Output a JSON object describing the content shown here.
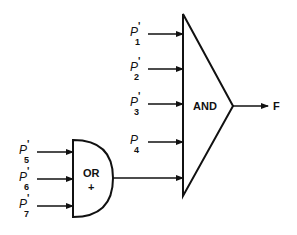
{
  "diagram": {
    "type": "logic-circuit",
    "and_gate": {
      "label": "AND",
      "inputs": [
        {
          "symbol": "P",
          "prime": "'",
          "subscript": "1"
        },
        {
          "symbol": "P",
          "prime": "'",
          "subscript": "2"
        },
        {
          "symbol": "P",
          "prime": "'",
          "subscript": "3"
        },
        {
          "symbol": "P",
          "prime": "",
          "subscript": "4"
        }
      ],
      "output": "F"
    },
    "or_gate": {
      "label": "OR",
      "symbol": "+",
      "inputs": [
        {
          "symbol": "P",
          "prime": "'",
          "subscript": "5"
        },
        {
          "symbol": "P",
          "prime": "'",
          "subscript": "6"
        },
        {
          "symbol": "P",
          "prime": "'",
          "subscript": "7"
        }
      ]
    },
    "colors": {
      "line": "#111111",
      "background": "#ffffff"
    }
  }
}
